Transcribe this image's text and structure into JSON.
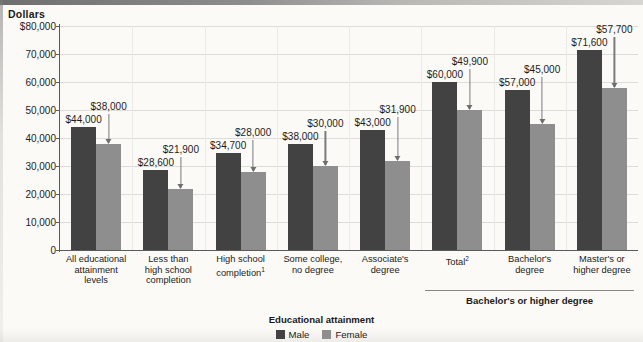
{
  "axis_title": "Dollars",
  "y_ticks": [
    "$80,000",
    "70,000",
    "60,000",
    "50,000",
    "40,000",
    "30,000",
    "20,000",
    "10,000",
    "0"
  ],
  "bracket": {
    "label": "Bachelor's or higher degree"
  },
  "legend": {
    "title": "Educational attainment",
    "male_label": "Male",
    "female_label": "Female",
    "male_color": "#424242",
    "female_color": "#8e8e8e"
  },
  "chart_data": {
    "type": "bar",
    "title": "",
    "xlabel": "Educational attainment",
    "ylabel": "Dollars",
    "ylim": [
      0,
      80000
    ],
    "ytick_values": [
      0,
      10000,
      20000,
      30000,
      40000,
      50000,
      60000,
      70000,
      80000
    ],
    "grid": true,
    "legend_position": "bottom-center",
    "categories": [
      "All educational attainment levels",
      "Less than high school completion",
      "High school completion",
      "Some college, no degree",
      "Associate's degree",
      "Total",
      "Bachelor's degree",
      "Master's or higher degree"
    ],
    "category_lines": [
      [
        "All educational",
        "attainment",
        "levels"
      ],
      [
        "Less than",
        "high school",
        "completion"
      ],
      [
        "High school",
        "completion"
      ],
      [
        "Some college,",
        "no degree"
      ],
      [
        "Associate's",
        "degree"
      ],
      [
        "Total"
      ],
      [
        "Bachelor's",
        "degree"
      ],
      [
        "Master's or",
        "higher degree"
      ]
    ],
    "category_footnotes": [
      "",
      "",
      "1",
      "",
      "",
      "2",
      "",
      ""
    ],
    "series": [
      {
        "name": "Male",
        "values": [
          44000,
          28600,
          34700,
          38000,
          43000,
          60000,
          57000,
          71600
        ],
        "labels": [
          "$44,000",
          "$28,600",
          "$34,700",
          "$38,000",
          "$43,000",
          "$60,000",
          "$57,000",
          "$71,600"
        ]
      },
      {
        "name": "Female",
        "values": [
          38000,
          21900,
          28000,
          30000,
          31900,
          49900,
          45000,
          57700
        ],
        "labels": [
          "$38,000",
          "$21,900",
          "$28,000",
          "$30,000",
          "$31,900",
          "$49,900",
          "$45,000",
          "$57,700"
        ]
      }
    ],
    "bracket_group_indices": [
      5,
      6,
      7
    ],
    "bracket_label": "Bachelor's or higher degree"
  }
}
